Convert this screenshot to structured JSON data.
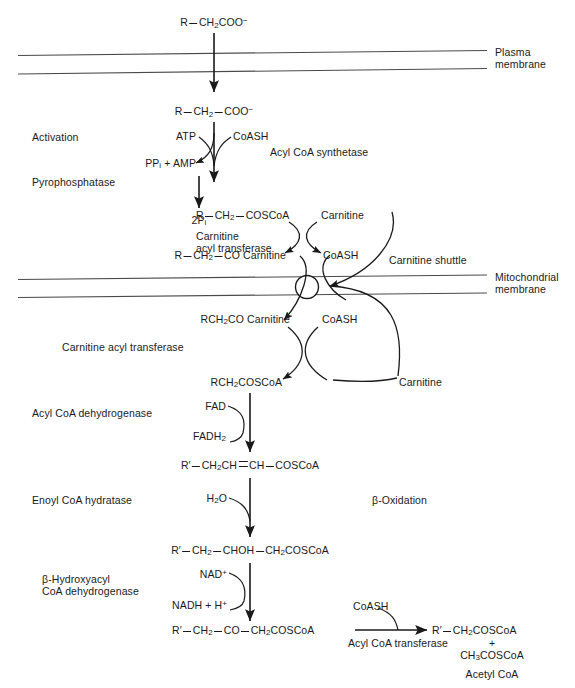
{
  "diagram": {
    "membranes": [
      {
        "name": "plasma-membrane",
        "label_line1": "Plasma",
        "label_line2": "membrane"
      },
      {
        "name": "mitochondrial-membrane",
        "label_line1": "Mitochondrial",
        "label_line2": "membrane"
      }
    ],
    "metabolites": {
      "substrate_top": {
        "r": "R",
        "rest": "CH",
        "sub": "2",
        "tail": "COO",
        "charge": "−"
      },
      "substrate_inner": {
        "r": "R",
        "mid": "CH",
        "sub": "2",
        "tail": "COO",
        "charge": "−"
      },
      "acyl_coa": {
        "r": "R",
        "mid": "CH",
        "sub": "2",
        "tail": "COSCoA"
      },
      "acyl_carnitine_out": {
        "r": "R",
        "mid": "CH",
        "sub": "2",
        "tail": "CO Carnitine"
      },
      "acyl_carnitine_in": {
        "text": "RCH",
        "sub": "2",
        "tail": "CO Carnitine"
      },
      "acyl_coa_matrix": {
        "text": "RCH",
        "sub": "2",
        "tail": "COSCoA"
      },
      "enoyl_coa": {
        "r": "R′",
        "p1": "CH",
        "sub1": "2",
        "p2": "CH",
        "p3": "CH",
        "tail": "COSCoA"
      },
      "hydroxyacyl_coa": {
        "r": "R′",
        "p1": "CH",
        "sub1": "2",
        "p2": "CHOH",
        "p3": "CH",
        "sub2": "2",
        "tail": "COSCoA"
      },
      "ketoacyl_coa": {
        "r": "R′",
        "p1": "CH",
        "sub1": "2",
        "p2": "CO",
        "p3": "CH",
        "sub2": "2",
        "tail": "COSCoA"
      },
      "shortened_acyl_coa": {
        "r": "R′",
        "p1": "CH",
        "sub1": "2",
        "tail": "COSCoA"
      },
      "acetyl_coa_formula": {
        "p1": "CH",
        "sub1": "3",
        "tail": "COSCoA"
      },
      "acetyl_coa_name": "Acetyl CoA",
      "plus_sign": "+"
    },
    "cofactors": {
      "atp": "ATP",
      "coash_1": "CoASH",
      "ppi_amp": {
        "pre": "PP",
        "sub": "i",
        "post": " + AMP"
      },
      "two_pi": {
        "pre": "2P",
        "sub": "i"
      },
      "carnitine_1": "Carnitine",
      "coash_2": "CoASH",
      "coash_3": "CoASH",
      "carnitine_2": "Carnitine",
      "fad": "FAD",
      "fadh2": {
        "pre": "FADH",
        "sub": "2"
      },
      "water": {
        "pre": "H",
        "sub": "2",
        "post": "O"
      },
      "nad_plus": {
        "pre": "NAD",
        "sup": "+"
      },
      "nadh_h": {
        "pre": "NADH + H",
        "sup": "+"
      },
      "coash_4": "CoASH"
    },
    "enzymes": {
      "activation": "Activation",
      "acyl_coa_synthetase": "Acyl CoA synthetase",
      "pyrophosphatase": "Pyrophosphatase",
      "carnitine_acyl_transferase_out_l1": "Carnitine",
      "carnitine_acyl_transferase_out_l2": "acyl transferase",
      "carnitine_shuttle": "Carnitine shuttle",
      "carnitine_acyl_transferase_in": "Carnitine acyl transferase",
      "acyl_coa_dehydrogenase": "Acyl CoA dehydrogenase",
      "enoyl_coa_hydratase": "Enoyl CoA hydratase",
      "hydroxyacyl_dehydrogenase_l1": "β-Hydroxyacyl",
      "hydroxyacyl_dehydrogenase_l2": "CoA dehydrogenase",
      "acyl_coa_transferase": "Acyl CoA transferase",
      "beta_oxidation": "β-Oxidation"
    },
    "colors": {
      "ink": "#1a1a1a",
      "membrane_line": "#4a4a4a",
      "background": "#ffffff"
    }
  }
}
